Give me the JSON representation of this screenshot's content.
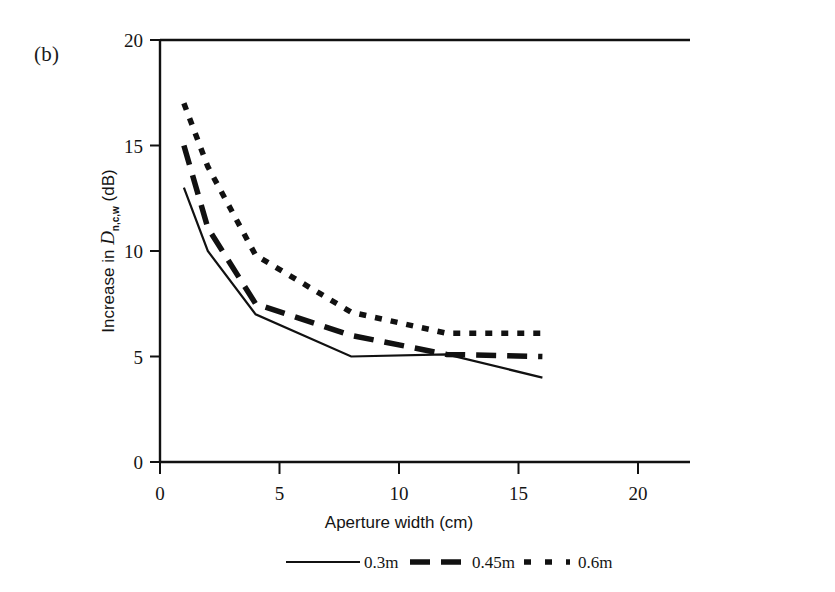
{
  "figure": {
    "panel_label": "(b)",
    "background_color": "#ffffff",
    "ink_color": "#111111"
  },
  "chart_data": {
    "type": "line",
    "title": "",
    "xlabel": "Aperture width (cm)",
    "ylabel_prefix": "Increase in ",
    "ylabel_symbol": "D",
    "ylabel_subscript": "n,c,w",
    "ylabel_units": " (dB)",
    "ylabel": "Increase in Dn,c,w (dB)",
    "xlim": [
      0,
      20
    ],
    "ylim": [
      0,
      20
    ],
    "xticks": [
      0,
      5,
      10,
      15,
      20
    ],
    "yticks": [
      0,
      5,
      10,
      15,
      20
    ],
    "xtick_labels": [
      "0",
      "5",
      "10",
      "15",
      "20"
    ],
    "ytick_labels": [
      "0",
      "5",
      "10",
      "15",
      "20"
    ],
    "grid": false,
    "legend_position": "below",
    "x": [
      1,
      2,
      4,
      8,
      12,
      16
    ],
    "series": [
      {
        "name": "0.3m",
        "style": "solid",
        "color": "#111111",
        "values": [
          13.0,
          10.0,
          7.0,
          5.0,
          5.1,
          4.0
        ]
      },
      {
        "name": "0.45m",
        "style": "dashed",
        "color": "#111111",
        "values": [
          15.0,
          11.1,
          7.5,
          6.0,
          5.1,
          5.0
        ]
      },
      {
        "name": "0.6m",
        "style": "dotted",
        "color": "#111111",
        "values": [
          17.0,
          14.0,
          9.8,
          7.1,
          6.1,
          6.1
        ]
      }
    ],
    "legend_entries": [
      {
        "label": "0.3m",
        "style": "solid"
      },
      {
        "label": "0.45m",
        "style": "dashed"
      },
      {
        "label": "0.6m",
        "style": "dotted"
      }
    ]
  }
}
